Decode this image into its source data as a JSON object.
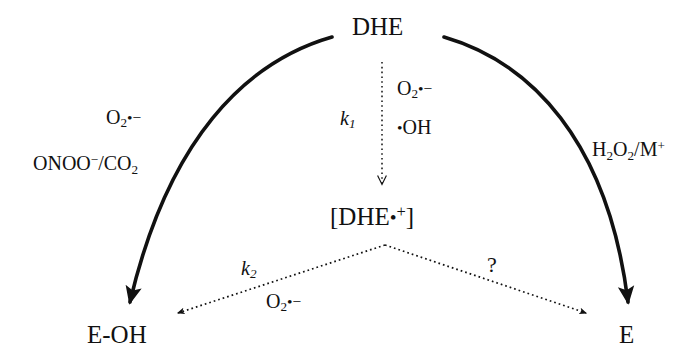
{
  "diagram": {
    "title_node": "DHE",
    "intermediate_node": "[DHE•+]",
    "product_left": "E-OH",
    "product_right": "E",
    "left_branch": {
      "reagent_top": "O2•−",
      "reagent_bottom": "ONOO−/CO2"
    },
    "center_branch": {
      "rate_constant": "k1",
      "oxidant_top": "O2•−",
      "oxidant_bottom": "•OH"
    },
    "right_branch": {
      "reagent": "H2O2/M+"
    },
    "lower_left_branch": {
      "rate_constant": "k2",
      "reagent": "O2•−"
    },
    "lower_right_branch": {
      "unknown_marker": "?"
    },
    "colors": {
      "stroke": "#111111",
      "background": "#ffffff"
    }
  }
}
